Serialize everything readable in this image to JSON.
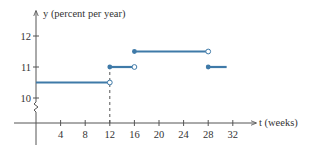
{
  "chart_data": {
    "type": "line",
    "subtype": "step-function",
    "title": "",
    "xlabel": "t (weeks)",
    "ylabel": "y (percent per year)",
    "x_ticks": [
      4,
      8,
      12,
      16,
      20,
      24,
      28,
      32
    ],
    "y_ticks": [
      10,
      11,
      12
    ],
    "xlim": [
      0,
      36
    ],
    "ylim": [
      10,
      12.3
    ],
    "y_axis_break": true,
    "grid": false,
    "series": [
      {
        "name": "interest rate",
        "color": "#3f7aa8",
        "segments": [
          {
            "x_start": 0,
            "x_end": 12,
            "y": 10.5,
            "start": "none",
            "end": "open"
          },
          {
            "x_start": 12,
            "x_end": 16,
            "y": 11,
            "start": "closed",
            "end": "open"
          },
          {
            "x_start": 16,
            "x_end": 28,
            "y": 11.5,
            "start": "closed",
            "end": "open"
          },
          {
            "x_start": 28,
            "x_end": 31,
            "y": 11,
            "start": "closed",
            "end": "none"
          }
        ]
      }
    ],
    "annotations": [
      {
        "type": "dashed-vertical",
        "x": 12,
        "from_y": "axis",
        "to_y": 11
      }
    ]
  },
  "labels": {
    "y_axis": "y (percent per year)",
    "x_axis": "t (weeks)"
  }
}
